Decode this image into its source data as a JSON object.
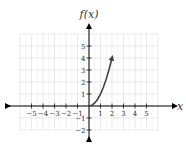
{
  "chart_data": {
    "type": "line",
    "title": "",
    "xlabel": "x",
    "ylabel": "f(x)",
    "xlim": [
      -6,
      6
    ],
    "ylim": [
      -2,
      6
    ],
    "grid": true,
    "x_ticks": [
      -5,
      -4,
      -3,
      -2,
      -1,
      1,
      2,
      3,
      4,
      5
    ],
    "y_ticks": [
      -2,
      -1,
      1,
      2,
      3,
      4,
      5
    ],
    "x_tick_labels": [
      "−5",
      "−4",
      "−3",
      "−2",
      "−1",
      "1",
      "2",
      "3",
      "4",
      "5"
    ],
    "y_tick_labels": [
      "−2",
      "−1",
      "1",
      "2",
      "3",
      "4",
      "5"
    ],
    "series": [
      {
        "name": "f(x) = x^2, x ≥ 0",
        "x": [
          0,
          0.25,
          0.5,
          0.75,
          1,
          1.25,
          1.5,
          1.75,
          2
        ],
        "y": [
          0,
          0.0625,
          0.25,
          0.5625,
          1,
          1.5625,
          2.25,
          3.0625,
          4
        ],
        "start_marker": "none",
        "end_marker": "arrow"
      }
    ],
    "annotations": []
  },
  "colors": {
    "axis": "#000000",
    "grid": "#dcdcdc",
    "curve": "#444444",
    "text": "#333333"
  }
}
